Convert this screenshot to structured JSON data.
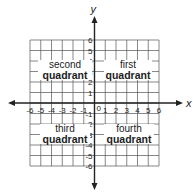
{
  "axes": {
    "x_label": "x",
    "y_label": "y",
    "x_ticks": [
      "-6",
      "-5",
      "-4",
      "-3",
      "-2",
      "-1",
      "1",
      "2",
      "3",
      "4",
      "5",
      "6"
    ],
    "y_ticks_pos": [
      "6",
      "5",
      "4",
      "3",
      "2",
      "1"
    ],
    "y_ticks_neg": [
      "-1",
      "-2",
      "-3",
      "-4",
      "-5",
      "-6"
    ],
    "origin": "0",
    "range": [
      -6,
      6
    ]
  },
  "quadrants": {
    "first": {
      "line1": "first",
      "line2": "quadrant"
    },
    "second": {
      "line1": "second",
      "line2": "quadrant"
    },
    "third": {
      "line1": "third",
      "line2": "quadrant"
    },
    "fourth": {
      "line1": "fourth",
      "line2": "quadrant"
    }
  },
  "colors": {
    "grid": "#555555",
    "axis": "#222222",
    "text": "#222222"
  }
}
